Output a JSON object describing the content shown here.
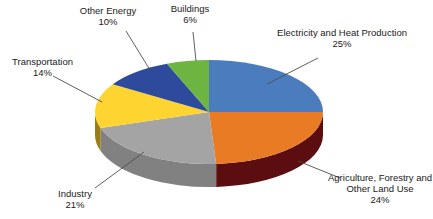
{
  "chart_data": {
    "type": "pie",
    "style": "3d-pie",
    "legend": "none",
    "background": "#ffffff",
    "categories": [
      "Electricity and Heat Production",
      "Agriculture, Forestry and Other Land Use",
      "Industry",
      "Transportation",
      "Other Energy",
      "Buildings"
    ],
    "values": [
      25,
      24,
      21,
      14,
      10,
      6
    ],
    "start_angle_deg": 0,
    "direction": "clockwise",
    "slices": [
      {
        "label": "Electricity and Heat Production",
        "value": 25,
        "pct": "25%",
        "color": "#4B7CBE",
        "side_color": "#2F5586"
      },
      {
        "label": "Agriculture, Forestry and Other Land Use",
        "value": 24,
        "pct": "24%",
        "color": "#EA7B25",
        "side_color": "#5B0D10"
      },
      {
        "label": "Industry",
        "value": 21,
        "pct": "21%",
        "color": "#A4A4A4",
        "side_color": "#818181"
      },
      {
        "label": "Transportation",
        "value": 14,
        "pct": "14%",
        "color": "#FED431",
        "side_color": "#9A7D14"
      },
      {
        "label": "Other Energy",
        "value": 10,
        "pct": "10%",
        "color": "#2E4A9C",
        "side_color": "#1E3166"
      },
      {
        "label": "Buildings",
        "value": 6,
        "pct": "6%",
        "color": "#6DB440",
        "side_color": "#477A28"
      }
    ],
    "callout_line_color": "#4d4d4d",
    "text_color": "#1a1a1a"
  }
}
